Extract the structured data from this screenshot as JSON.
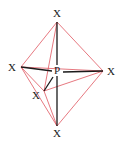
{
  "diagram": {
    "title": "",
    "center_atom": {
      "label": "P",
      "x": 57,
      "y": 70
    },
    "ligands": [
      {
        "id": "top",
        "label": "X",
        "vx": 57,
        "vy": 22,
        "lx": 57,
        "ly": 17
      },
      {
        "id": "left",
        "label": "X",
        "vx": 21,
        "vy": 67,
        "lx": 12,
        "ly": 71
      },
      {
        "id": "right",
        "label": "X",
        "vx": 103,
        "vy": 71,
        "lx": 111,
        "ly": 75
      },
      {
        "id": "front",
        "label": "X",
        "vx": 44,
        "vy": 91,
        "lx": 36,
        "ly": 99
      },
      {
        "id": "bottom",
        "label": "X",
        "vx": 57,
        "vy": 126,
        "lx": 57,
        "ly": 137
      }
    ],
    "colors": {
      "bond": "#1a1a1a",
      "edge": "#e0555f"
    }
  }
}
